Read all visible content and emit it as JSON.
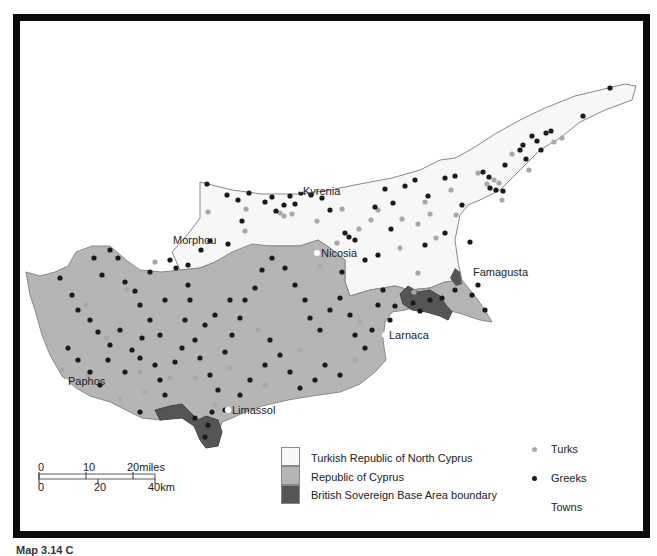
{
  "map": {
    "colors": {
      "trnc": "#f7f7f7",
      "roc": "#b5b5b5",
      "sba": "#555555",
      "turks": "#a8a8a8",
      "greeks": "#1a1a1a",
      "towns": "#ffffff",
      "outline": "#888888",
      "frame": "#0a0a0a"
    },
    "towns": [
      {
        "name": "Kyrenia",
        "label_x": 303,
        "label_y": 187
      },
      {
        "name": "Morphou",
        "label_x": 173,
        "label_y": 237
      },
      {
        "name": "Nicosia",
        "label_x": 320,
        "label_y": 248
      },
      {
        "name": "Famagusta",
        "label_x": 473,
        "label_y": 268
      },
      {
        "name": "Larnaca",
        "label_x": 389,
        "label_y": 331
      },
      {
        "name": "Paphos",
        "label_x": 68,
        "label_y": 378
      },
      {
        "name": "Limassol",
        "label_x": 232,
        "label_y": 406
      }
    ]
  },
  "legend": {
    "areas": [
      {
        "label": "Turkish Republic of North Cyprus",
        "color": "#f7f7f7"
      },
      {
        "label": "Republic of Cyprus",
        "color": "#b5b5b5"
      },
      {
        "label": "British Sovereign Base Area boundary",
        "color": "#555555"
      }
    ],
    "points": [
      {
        "label": "Turks",
        "color": "#a8a8a8"
      },
      {
        "label": "Greeks",
        "color": "#1a1a1a"
      },
      {
        "label": "Towns",
        "color": "#ffffff"
      }
    ]
  },
  "scale": {
    "miles_ticks": [
      "0",
      "10",
      "20miles"
    ],
    "km_ticks": [
      "0",
      "20",
      "40km"
    ]
  },
  "caption": "Map 3.14  C"
}
